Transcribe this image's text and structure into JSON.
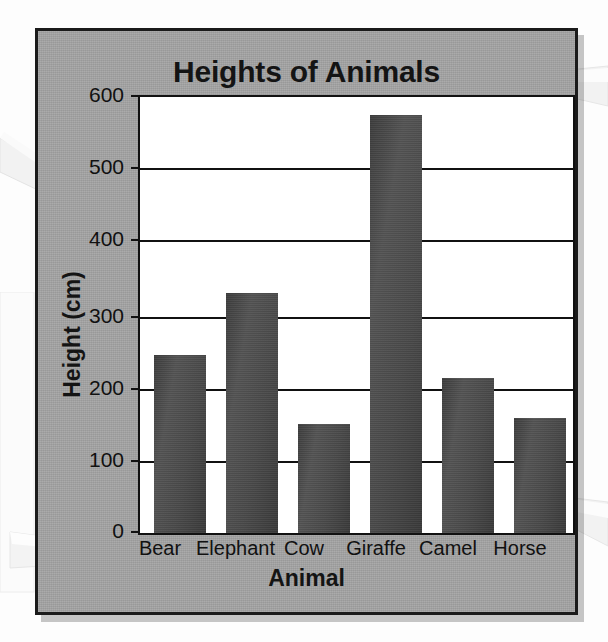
{
  "chart_data": {
    "type": "bar",
    "title": "Heights of Animals",
    "xlabel": "Animal",
    "ylabel": "Height (cm)",
    "categories": [
      "Bear",
      "Elephant",
      "Cow",
      "Giraffe",
      "Camel",
      "Horse"
    ],
    "values": [
      245,
      330,
      150,
      575,
      213,
      158
    ],
    "ylim": [
      0,
      600
    ],
    "ytick_labels": [
      "0",
      "100",
      "200",
      "300",
      "400",
      "500",
      "600"
    ],
    "ytick_values": [
      0,
      100,
      200,
      300,
      400,
      500,
      600
    ],
    "grid": "horizontal",
    "legend": "none",
    "bar_color": "#4a4a4a",
    "panel_color": "#a3a3a3",
    "plot_background": "#ffffff",
    "axis_color": "#111111"
  },
  "annotations": {
    "pointer_top_left": "white-pointer-arrow",
    "pointer_title_right": "white-pointer-arrow",
    "pointer_bottom_left": "white-callout-arrow",
    "pointer_horse_right": "white-pointer-arrow"
  }
}
